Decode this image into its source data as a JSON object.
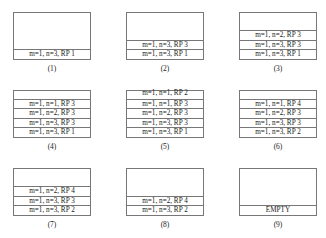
{
  "panels": [
    {
      "caption": "(1)",
      "cells": [
        "m=1, n=3, RP 1"
      ]
    },
    {
      "caption": "(2)",
      "cells": [
        "m=1, n=3, RP 3",
        "m=1, n=3, RP 1"
      ]
    },
    {
      "caption": "(3)",
      "cells": [
        "m=1, n=2, RP 3",
        "m=1, n=3, RP 3",
        "m=1, n=3, RP 1"
      ]
    },
    {
      "caption": "(4)",
      "cells": [
        "m=1, n=1, RP 3",
        "m=1, n=2, RP 3",
        "m=1, n=3, RP 3",
        "m=1, n=3, RP 1"
      ]
    },
    {
      "caption": "(5)",
      "cells": [
        "m=1, n=1, RP 2",
        "m=1, n=1, RP 3",
        "m=1, n=2, RP 3",
        "m=1, n=3, RP 3",
        "m=1, n=3, RP 1"
      ]
    },
    {
      "caption": "(6)",
      "cells": [
        "m=1, n=1, RP 4",
        "m=1, n=2, RP 3",
        "m=1, n=3, RP 3",
        "m=1, n=3, RP 2"
      ]
    },
    {
      "caption": "(7)",
      "cells": [
        "m=1, n=2, RP 4",
        "m=1, n=3, RP 3",
        "m=1, n=3, RP 2"
      ]
    },
    {
      "caption": "(8)",
      "cells": [
        "m=1, n=2, RP 4",
        "m=1, n=3, RP 2"
      ]
    },
    {
      "caption": "(9)",
      "cells": [
        "EMPTY"
      ]
    }
  ]
}
